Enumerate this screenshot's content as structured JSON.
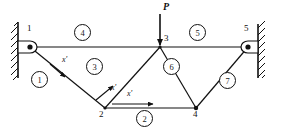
{
  "diagram": {
    "type": "structural-truss",
    "load": {
      "label": "P",
      "direction": "downward",
      "applied_at_node": "3",
      "arrow_x": 160,
      "arrow_top_y": 14,
      "arrow_bottom_y": 47
    },
    "supports": [
      {
        "name": "left-support",
        "at_node": "1",
        "kind": "pinned-wall",
        "wall_x": 18,
        "wall_top": 22,
        "wall_bottom": 78,
        "hatch_side": "left"
      },
      {
        "name": "right-support",
        "at_node": "5",
        "kind": "pinned-wall",
        "wall_x": 258,
        "wall_top": 24,
        "wall_bottom": 78,
        "hatch_side": "right"
      }
    ],
    "nodes": [
      {
        "id": "1",
        "x": 30,
        "y": 47,
        "label": "1",
        "label_x": 27,
        "label_y": 28
      },
      {
        "id": "2",
        "x": 105,
        "y": 108,
        "label": "2",
        "label_x": 99,
        "label_y": 111
      },
      {
        "id": "3",
        "x": 160,
        "y": 47,
        "label": "3",
        "label_x": 163,
        "label_y": 36
      },
      {
        "id": "4",
        "x": 196,
        "y": 108,
        "label": "4",
        "label_x": 193,
        "label_y": 111
      },
      {
        "id": "5",
        "x": 248,
        "y": 47,
        "label": "5",
        "label_x": 243,
        "label_y": 28
      }
    ],
    "members": [
      {
        "id": "1",
        "from": "1",
        "to": "2",
        "label": "1",
        "circle_x": 38,
        "circle_y": 78
      },
      {
        "id": "2",
        "from": "2",
        "to": "4",
        "label": "2",
        "circle_x": 143,
        "circle_y": 117
      },
      {
        "id": "3",
        "from": "2",
        "to": "3",
        "label": "3",
        "circle_x": 93,
        "circle_y": 65
      },
      {
        "id": "4",
        "from": "1",
        "to": "3",
        "label": "4",
        "circle_x": 81,
        "circle_y": 31
      },
      {
        "id": "5",
        "from": "3",
        "to": "5",
        "label": "5",
        "circle_x": 196,
        "circle_y": 31
      },
      {
        "id": "6",
        "from": "3",
        "to": "4",
        "label": "6",
        "circle_x": 170,
        "circle_y": 65
      },
      {
        "id": "7",
        "from": "4",
        "to": "5",
        "label": "7",
        "circle_x": 226,
        "circle_y": 79
      }
    ],
    "local_axes": [
      {
        "name": "member-1-local-axis",
        "label": "x'",
        "on_member": "1",
        "label_x": 62,
        "label_y": 61,
        "arrow_x1": 50,
        "arrow_y1": 64,
        "arrow_x2": 64,
        "arrow_y2": 76
      },
      {
        "name": "member-3-local-axis",
        "label": "x'",
        "on_member": "3",
        "label_x": 110,
        "label_y": 83,
        "arrow_x1": 96,
        "arrow_y1": 99,
        "arrow_x2": 112,
        "arrow_y2": 86
      },
      {
        "name": "member-2-local-axis",
        "label": "x'",
        "on_member": "2",
        "label_x": 128,
        "label_y": 93,
        "arrow_x1": 112,
        "arrow_y1": 104,
        "arrow_x2": 152,
        "arrow_y2": 104
      }
    ],
    "colors": {
      "line": "#111111",
      "wall": "#111111",
      "background": "#ffffff"
    }
  }
}
